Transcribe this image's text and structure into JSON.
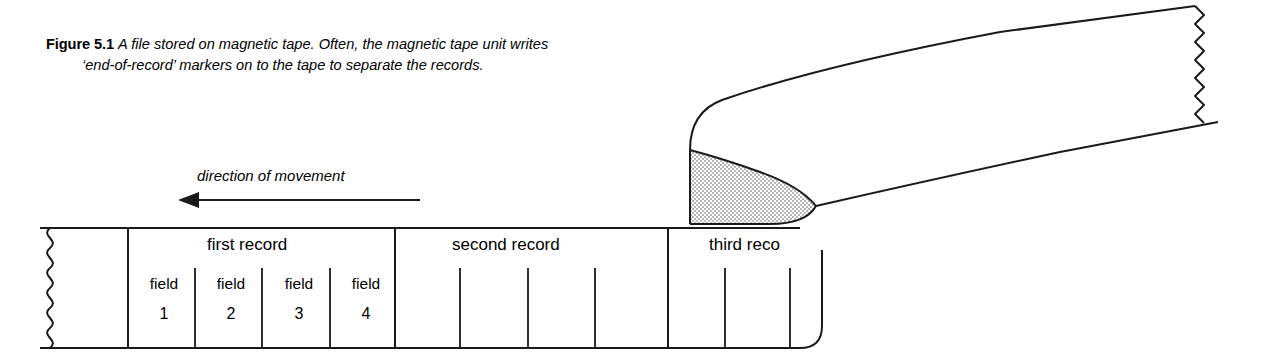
{
  "figure": {
    "label": "Figure 5.1",
    "caption_line1": "A file stored on magnetic tape. Often, the magnetic tape unit writes",
    "caption_line2": "‘end-of-record’ markers on to the tape to separate the records.",
    "direction_label": "direction of movement",
    "arrow_direction": "left"
  },
  "colors": {
    "background": "#ffffff",
    "ink": "#1a1a1a",
    "stipple_fill": "#dcdcdc",
    "stipple_dot": "#555555"
  },
  "tape": {
    "left_edge_style": "torn-zigzag",
    "right_edge_style": "torn-zigzag",
    "records": [
      {
        "name": "first record",
        "label_clipped": false,
        "fields": [
          {
            "word": "field",
            "number": "1"
          },
          {
            "word": "field",
            "number": "2"
          },
          {
            "word": "field",
            "number": "3"
          },
          {
            "word": "field",
            "number": "4"
          }
        ]
      },
      {
        "name": "second record",
        "label_clipped": false,
        "fields": [
          {
            "word": "",
            "number": ""
          },
          {
            "word": "",
            "number": ""
          },
          {
            "word": "",
            "number": ""
          },
          {
            "word": "",
            "number": ""
          }
        ]
      },
      {
        "name": "third reco",
        "label_clipped": true,
        "fields": [
          {
            "word": "",
            "number": ""
          },
          {
            "word": "",
            "number": ""
          },
          {
            "word": "",
            "number": ""
          }
        ]
      }
    ]
  },
  "geometry": {
    "strip_top": 228,
    "strip_bottom": 348,
    "strip_left": 40,
    "strip_right": 822,
    "record_boundaries": [
      128,
      395,
      668
    ],
    "first_record_field_dividers": [
      195,
      262,
      330
    ],
    "second_record_field_dividers": [
      460,
      528,
      595
    ],
    "third_record_field_dividers": [
      725,
      790
    ],
    "arrow_tip_x": 180,
    "arrow_tail_x": 420,
    "arrow_y": 200
  }
}
